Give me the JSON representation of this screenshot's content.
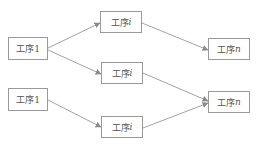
{
  "diagram": {
    "colors": {
      "line": "#8a8a8a",
      "border": "#9a9a9a",
      "text": "#555555",
      "background": "#ffffff"
    },
    "nodes": [
      {
        "id": "a",
        "prefix": "工序",
        "suffix": "1",
        "suffix_italic": false,
        "x": 8,
        "y": 37,
        "w": 40,
        "h": 23
      },
      {
        "id": "b",
        "prefix": "工序",
        "suffix": "i",
        "suffix_italic": true,
        "x": 100,
        "y": 11,
        "w": 42,
        "h": 22
      },
      {
        "id": "c",
        "prefix": "工序",
        "suffix": "n",
        "suffix_italic": true,
        "x": 208,
        "y": 38,
        "w": 42,
        "h": 22
      },
      {
        "id": "d",
        "prefix": "工序",
        "suffix": "i",
        "suffix_italic": true,
        "x": 101,
        "y": 62,
        "w": 42,
        "h": 22
      },
      {
        "id": "e",
        "prefix": "工序",
        "suffix": "1",
        "suffix_italic": false,
        "x": 8,
        "y": 88,
        "w": 40,
        "h": 23
      },
      {
        "id": "f",
        "prefix": "工序",
        "suffix": "i",
        "suffix_italic": true,
        "x": 101,
        "y": 116,
        "w": 42,
        "h": 22
      },
      {
        "id": "g",
        "prefix": "工序",
        "suffix": "n",
        "suffix_italic": true,
        "x": 208,
        "y": 91,
        "w": 42,
        "h": 22
      }
    ],
    "edges": [
      {
        "from": "a",
        "to": "b",
        "x1": 48,
        "y1": 48,
        "x2": 100,
        "y2": 23
      },
      {
        "from": "a",
        "to": "d",
        "x1": 48,
        "y1": 50,
        "x2": 101,
        "y2": 74
      },
      {
        "from": "b",
        "to": "c",
        "x1": 142,
        "y1": 23,
        "x2": 208,
        "y2": 50
      },
      {
        "from": "d",
        "to": "g",
        "x1": 143,
        "y1": 73,
        "x2": 208,
        "y2": 101
      },
      {
        "from": "e",
        "to": "f",
        "x1": 48,
        "y1": 100,
        "x2": 101,
        "y2": 127
      },
      {
        "from": "f",
        "to": "g",
        "x1": 143,
        "y1": 128,
        "x2": 208,
        "y2": 103
      }
    ]
  }
}
